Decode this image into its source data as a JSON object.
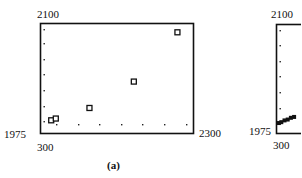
{
  "chart_data": [
    {
      "panel": "(a)",
      "type": "scatter",
      "title": "",
      "caption": "(a)",
      "xlabel": "",
      "ylabel": "",
      "xlim": [
        300,
        2300
      ],
      "ylim": [
        1975,
        2100
      ],
      "x_tick_labels": [
        "300",
        "2300"
      ],
      "y_tick_labels": [
        "1975",
        "2100"
      ],
      "grid": "dotted tick marks along left and bottom edges",
      "marker": "hollow square",
      "points": [
        {
          "x": 440,
          "y": 1990
        },
        {
          "x": 500,
          "y": 1992
        },
        {
          "x": 940,
          "y": 2004
        },
        {
          "x": 1520,
          "y": 2034
        },
        {
          "x": 2090,
          "y": 2090
        }
      ]
    },
    {
      "panel": "(b)",
      "type": "scatter",
      "title": "",
      "caption": "",
      "xlim": [
        300,
        null
      ],
      "ylim": [
        1975,
        2100
      ],
      "x_tick_labels": [
        "300"
      ],
      "y_tick_labels": [
        "1975",
        "2100"
      ],
      "note": "partially visible (cut off at right edge)",
      "points": [
        {
          "x": 330,
          "y": 1987
        },
        {
          "x": 360,
          "y": 1988
        },
        {
          "x": 400,
          "y": 1990
        },
        {
          "x": 440,
          "y": 1991
        },
        {
          "x": 480,
          "y": 1993
        },
        {
          "x": 520,
          "y": 1994
        }
      ]
    }
  ]
}
